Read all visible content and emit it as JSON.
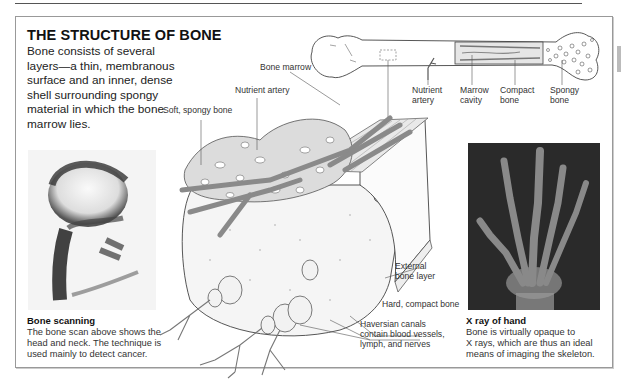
{
  "header": {
    "title": "THE STRUCTURE OF BONE",
    "intro": "Bone consists of several layers—a thin, membranous surface and an inner, dense shell surrounding spongy material in which the bone marrow lies."
  },
  "long_bone_labels": {
    "nutrient_artery": [
      "Nutrient",
      "artery"
    ],
    "marrow_cavity": [
      "Marrow",
      "cavity"
    ],
    "compact_bone": [
      "Compact",
      "bone"
    ],
    "spongy_bone": [
      "Spongy",
      "bone"
    ]
  },
  "cross_section_labels": {
    "bone_marrow": "Bone marrow",
    "nutrient_artery": "Nutrient artery",
    "soft_spongy_bone": "Soft, spongy bone",
    "external_bone_layer": [
      "External",
      "bone layer"
    ],
    "hard_compact_bone": "Hard, compact bone",
    "haversian_canals": [
      "Haversian canals",
      "contain blood vessels,",
      "lymph, and nerves"
    ]
  },
  "bone_scan": {
    "heading": "Bone scanning",
    "lines": [
      "The bone scan above shows the",
      "head and neck. The technique is",
      "used mainly to detect cancer."
    ]
  },
  "xray": {
    "heading": "X ray of hand",
    "lines": [
      "Bone is virtually opaque to",
      "X rays, which are thus an ideal",
      "means of imaging the skeleton."
    ]
  },
  "colors": {
    "artery": "#8a8a8a",
    "frame": "#999999",
    "xray_bg": "#2a2a2a"
  }
}
